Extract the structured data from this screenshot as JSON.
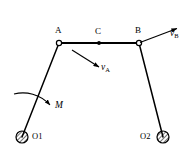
{
  "figure": {
    "type": "mechanism-diagram",
    "background_color": "#ffffff",
    "stroke_color": "#000000",
    "canvas": {
      "width": 196,
      "height": 156
    }
  },
  "labels": {
    "point_a": "A",
    "point_c": "C",
    "point_b": "B",
    "pivot_o1": "O1",
    "pivot_o2": "O2",
    "velocity_a_symbol": "v",
    "velocity_a_subscript": "A",
    "velocity_b_symbol": "v",
    "velocity_b_subscript": "B",
    "moment": "M"
  },
  "geometry": {
    "joint_a": {
      "x": 59,
      "y": 43
    },
    "joint_c": {
      "x": 99,
      "y": 43
    },
    "joint_b": {
      "x": 139,
      "y": 43
    },
    "pivot_o1": {
      "x": 22,
      "y": 137,
      "r": 6
    },
    "pivot_o2": {
      "x": 163,
      "y": 137,
      "r": 6
    },
    "coupler_ab": {
      "x1": 59,
      "y1": 43,
      "x2": 139,
      "y2": 43
    },
    "crank_o1a": {
      "x1": 22,
      "y1": 137,
      "x2": 59,
      "y2": 43
    },
    "crank_o2b": {
      "x1": 163,
      "y1": 137,
      "x2": 139,
      "y2": 43
    },
    "velocity_a_arrow": {
      "x1": 72,
      "y1": 50,
      "x2": 100,
      "y2": 68
    },
    "velocity_b_arrow": {
      "x1": 140,
      "y1": 42,
      "x2": 178,
      "y2": 28
    },
    "moment_arc": {
      "start_x": 15,
      "start_y": 95,
      "end_x": 51,
      "end_y": 106
    }
  },
  "label_positions": {
    "point_a": {
      "x": 55,
      "y": 28
    },
    "point_c": {
      "x": 95,
      "y": 29
    },
    "point_b": {
      "x": 135,
      "y": 28
    },
    "pivot_o1": {
      "x": 32,
      "y": 132
    },
    "pivot_o2": {
      "x": 140,
      "y": 132
    },
    "velocity_a": {
      "x": 101,
      "y": 64
    },
    "velocity_b": {
      "x": 170,
      "y": 30
    },
    "moment": {
      "x": 55,
      "y": 102
    }
  }
}
